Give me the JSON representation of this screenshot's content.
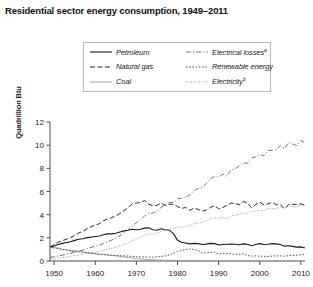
{
  "chart_data": {
    "type": "line",
    "title": "Residential sector energy consumption, 1949–2011",
    "xlabel": "",
    "ylabel": "Quadrillion Btu",
    "xlim": [
      1949,
      2011
    ],
    "ylim": [
      0,
      12
    ],
    "grid": false,
    "legend_position": "top-center",
    "x_ticks": [
      "1950",
      "1960",
      "1970",
      "1980",
      "1990",
      "2000",
      "2010"
    ],
    "x_tick_values": [
      1950,
      1960,
      1970,
      1980,
      1990,
      2000,
      2010
    ],
    "y_ticks": [
      "0",
      "2",
      "4",
      "6",
      "8",
      "10",
      "12"
    ],
    "y_tick_values": [
      0,
      2,
      4,
      6,
      8,
      10,
      12
    ],
    "x": [
      1949,
      1950,
      1951,
      1952,
      1953,
      1954,
      1955,
      1956,
      1957,
      1958,
      1959,
      1960,
      1961,
      1962,
      1963,
      1964,
      1965,
      1966,
      1967,
      1968,
      1969,
      1970,
      1971,
      1972,
      1973,
      1974,
      1975,
      1976,
      1977,
      1978,
      1979,
      1980,
      1981,
      1982,
      1983,
      1984,
      1985,
      1986,
      1987,
      1988,
      1989,
      1990,
      1991,
      1992,
      1993,
      1994,
      1995,
      1996,
      1997,
      1998,
      1999,
      2000,
      2001,
      2002,
      2003,
      2004,
      2005,
      2006,
      2007,
      2008,
      2009,
      2010,
      2011
    ],
    "series": [
      {
        "name": "Petroleum",
        "style": "solid",
        "color": "#1a1a1a",
        "width": 1.1,
        "values": [
          1.2,
          1.3,
          1.42,
          1.52,
          1.6,
          1.66,
          1.78,
          1.88,
          1.92,
          2.02,
          2.06,
          2.12,
          2.16,
          2.26,
          2.34,
          2.34,
          2.4,
          2.5,
          2.6,
          2.66,
          2.74,
          2.7,
          2.74,
          2.84,
          2.86,
          2.7,
          2.66,
          2.78,
          2.7,
          2.66,
          2.36,
          1.8,
          1.62,
          1.56,
          1.48,
          1.52,
          1.5,
          1.42,
          1.46,
          1.52,
          1.5,
          1.38,
          1.42,
          1.44,
          1.46,
          1.44,
          1.4,
          1.48,
          1.44,
          1.32,
          1.42,
          1.5,
          1.42,
          1.44,
          1.5,
          1.48,
          1.42,
          1.28,
          1.32,
          1.26,
          1.2,
          1.22,
          1.12
        ]
      },
      {
        "name": "Natural gas",
        "style": "dashed",
        "color": "#2b2b2b",
        "width": 1.0,
        "values": [
          1.22,
          1.4,
          1.62,
          1.76,
          1.88,
          2.02,
          2.22,
          2.42,
          2.56,
          2.78,
          2.96,
          3.1,
          3.22,
          3.48,
          3.62,
          3.74,
          3.9,
          4.1,
          4.34,
          4.62,
          4.92,
          5.0,
          5.06,
          5.22,
          4.9,
          4.78,
          4.8,
          5.0,
          4.8,
          4.9,
          4.9,
          4.7,
          4.54,
          4.62,
          4.38,
          4.56,
          4.46,
          4.3,
          4.4,
          4.62,
          4.78,
          4.52,
          4.62,
          4.8,
          5.0,
          4.98,
          4.86,
          5.14,
          5.02,
          4.6,
          4.88,
          5.08,
          4.84,
          4.94,
          5.06,
          4.86,
          4.86,
          4.52,
          4.86,
          4.9,
          4.88,
          4.94,
          4.8
        ]
      },
      {
        "name": "Coal",
        "style": "solid",
        "color": "#a6a6a6",
        "width": 1.0,
        "values": [
          1.18,
          1.16,
          1.12,
          1.02,
          0.96,
          0.88,
          0.86,
          0.84,
          0.76,
          0.74,
          0.68,
          0.64,
          0.58,
          0.56,
          0.52,
          0.48,
          0.44,
          0.4,
          0.34,
          0.3,
          0.26,
          0.22,
          0.18,
          0.15,
          0.12,
          0.1,
          0.08,
          0.08,
          0.07,
          0.06,
          0.06,
          0.05,
          0.05,
          0.05,
          0.05,
          0.05,
          0.05,
          0.04,
          0.04,
          0.04,
          0.04,
          0.04,
          0.04,
          0.04,
          0.04,
          0.04,
          0.03,
          0.03,
          0.03,
          0.03,
          0.03,
          0.03,
          0.03,
          0.02,
          0.02,
          0.02,
          0.02,
          0.01,
          0.01,
          0.01,
          0.01,
          0.01,
          0.01
        ]
      },
      {
        "name": "Electrical losses",
        "style": "dashdot",
        "color": "#777777",
        "width": 1.0,
        "values": [
          0.3,
          0.38,
          0.44,
          0.5,
          0.58,
          0.66,
          0.76,
          0.86,
          0.94,
          1.06,
          1.18,
          1.28,
          1.38,
          1.52,
          1.66,
          1.8,
          1.98,
          2.18,
          2.4,
          2.7,
          3.0,
          3.3,
          3.54,
          3.9,
          4.1,
          4.14,
          4.3,
          4.62,
          4.86,
          5.04,
          5.06,
          5.4,
          5.4,
          5.52,
          5.7,
          6.06,
          6.26,
          6.34,
          6.68,
          7.1,
          7.3,
          7.26,
          7.5,
          7.32,
          7.86,
          7.96,
          8.22,
          8.46,
          8.44,
          8.9,
          8.98,
          9.2,
          9.08,
          9.54,
          9.56,
          9.6,
          9.98,
          9.7,
          10.22,
          10.1,
          9.96,
          10.4,
          10.2
        ]
      },
      {
        "name": "Renewable energy",
        "style": "dotted",
        "color": "#555555",
        "width": 1.0,
        "values": [
          1.18,
          1.12,
          1.06,
          1.0,
          0.94,
          0.88,
          0.84,
          0.8,
          0.74,
          0.7,
          0.66,
          0.62,
          0.58,
          0.56,
          0.52,
          0.5,
          0.48,
          0.46,
          0.44,
          0.42,
          0.4,
          0.38,
          0.36,
          0.34,
          0.34,
          0.34,
          0.36,
          0.4,
          0.44,
          0.52,
          0.66,
          0.82,
          0.92,
          0.98,
          1.04,
          1.0,
          0.92,
          0.7,
          0.7,
          0.74,
          0.78,
          0.6,
          0.64,
          0.64,
          0.62,
          0.58,
          0.58,
          0.62,
          0.48,
          0.42,
          0.44,
          0.42,
          0.4,
          0.4,
          0.42,
          0.44,
          0.44,
          0.42,
          0.46,
          0.48,
          0.5,
          0.54,
          0.58
        ]
      },
      {
        "name": "Electricity",
        "style": "finedot",
        "color": "#8a8a8a",
        "width": 1.0,
        "values": [
          0.18,
          0.22,
          0.26,
          0.3,
          0.34,
          0.4,
          0.46,
          0.52,
          0.58,
          0.64,
          0.72,
          0.78,
          0.84,
          0.92,
          1.0,
          1.08,
          1.18,
          1.3,
          1.42,
          1.58,
          1.74,
          1.9,
          2.04,
          2.22,
          2.32,
          2.32,
          2.4,
          2.56,
          2.68,
          2.76,
          2.76,
          2.92,
          2.92,
          2.98,
          3.06,
          3.22,
          3.3,
          3.32,
          3.46,
          3.64,
          3.72,
          3.68,
          3.76,
          3.66,
          3.9,
          3.94,
          4.04,
          4.14,
          4.12,
          4.3,
          4.32,
          4.4,
          4.34,
          4.52,
          4.52,
          4.52,
          4.66,
          4.56,
          4.76,
          4.7,
          4.66,
          4.86,
          4.8
        ]
      }
    ]
  },
  "legend": {
    "items": [
      {
        "label": "Petroleum",
        "sup": "",
        "style": "solid",
        "color": "#1a1a1a"
      },
      {
        "label": "Electrical losses",
        "sup": "a",
        "style": "dashdot",
        "color": "#777777"
      },
      {
        "label": "Natural gas",
        "sup": "",
        "style": "dashed",
        "color": "#2b2b2b"
      },
      {
        "label": "Renewable energy",
        "sup": "",
        "style": "dotted",
        "color": "#555555"
      },
      {
        "label": "Coal",
        "sup": "",
        "style": "solid",
        "color": "#a6a6a6"
      },
      {
        "label": "Electricity",
        "sup": "b",
        "style": "finedot",
        "color": "#8a8a8a"
      }
    ]
  },
  "axis": {
    "y_title": "Quadrillion Btu"
  }
}
